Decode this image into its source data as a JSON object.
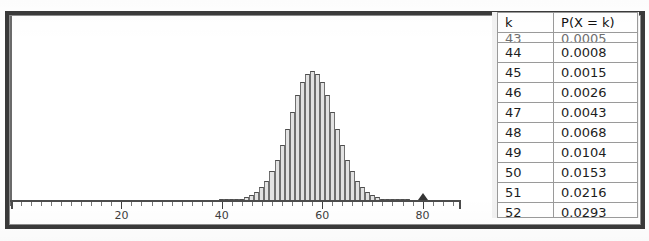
{
  "chart_data": {
    "type": "bar",
    "title": "",
    "xlabel": "",
    "ylabel": "",
    "xlim": [
      0,
      92
    ],
    "ylim": [
      0,
      0.075
    ],
    "grid": false,
    "legend": "none",
    "axis_ticks_major": [
      20,
      40,
      60,
      80
    ],
    "axis_tick_labels": [
      "20",
      "40",
      "60",
      "80"
    ],
    "marker": {
      "name": "triangle-marker",
      "x": 80,
      "label": "80"
    },
    "categories": [
      40,
      41,
      42,
      43,
      44,
      45,
      46,
      47,
      48,
      49,
      50,
      51,
      52,
      53,
      54,
      55,
      56,
      57,
      58,
      59,
      60,
      61,
      62,
      63,
      64,
      65,
      66,
      67,
      68,
      69,
      70,
      71,
      72,
      73,
      74,
      75,
      76,
      77,
      78,
      79,
      80
    ],
    "values": [
      0.0001,
      0.0002,
      0.0003,
      0.0005,
      0.0008,
      0.0015,
      0.0026,
      0.0043,
      0.0068,
      0.0104,
      0.0153,
      0.0216,
      0.0293,
      0.0382,
      0.0474,
      0.056,
      0.063,
      0.0676,
      0.0692,
      0.0676,
      0.063,
      0.056,
      0.0474,
      0.0382,
      0.0293,
      0.0216,
      0.0153,
      0.0104,
      0.0068,
      0.0043,
      0.0026,
      0.0015,
      0.0008,
      0.0005,
      0.0003,
      0.0002,
      0.0001,
      0.0001,
      0.0,
      0.0,
      0.0
    ]
  },
  "table": {
    "columns": [
      "k",
      "P(X = k)"
    ],
    "clipped_top_row": {
      "k": "43",
      "p": "0.0005"
    },
    "rows": [
      {
        "k": "44",
        "p": "0.0008"
      },
      {
        "k": "45",
        "p": "0.0015"
      },
      {
        "k": "46",
        "p": "0.0026"
      },
      {
        "k": "47",
        "p": "0.0043"
      },
      {
        "k": "48",
        "p": "0.0068"
      },
      {
        "k": "49",
        "p": "0.0104"
      },
      {
        "k": "50",
        "p": "0.0153"
      },
      {
        "k": "51",
        "p": "0.0216"
      },
      {
        "k": "52",
        "p": "0.0293"
      }
    ]
  },
  "colors": {
    "frame": "#3a3a3a",
    "axis": "#4b4b4b",
    "bar_fill": "#e2e2e2",
    "bar_stroke": "#707070",
    "table_border": "#9a9a9a",
    "text": "#1d1d1d",
    "panel_bg": "#f2f2f2"
  }
}
